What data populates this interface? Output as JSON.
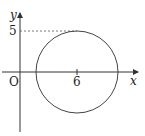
{
  "diagram": {
    "type": "coordinate-plane-circle",
    "axes": {
      "x_label": "x",
      "y_label": "y",
      "origin_label": "O"
    },
    "circle": {
      "center_x_label": "6",
      "top_y_label": "5",
      "center": [
        6,
        0
      ],
      "radius_units": 5
    },
    "colors": {
      "stroke": "#333333",
      "dashed": "#555555"
    }
  }
}
